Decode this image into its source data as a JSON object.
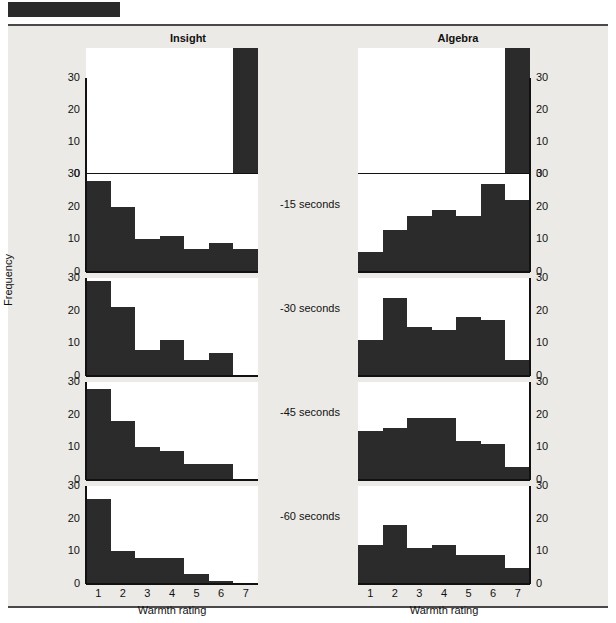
{
  "header": {
    "redacted_bar": true
  },
  "figure": {
    "column_titles": [
      "Insight",
      "Algebra"
    ],
    "ylabel": "Frequency",
    "xlabel": "Warmth rating",
    "row_labels": [
      "",
      "-15 seconds",
      "-30 seconds",
      "-45 seconds",
      "-60 seconds"
    ],
    "bar_color": "#2b2b2b",
    "plate_background": "#eceae6",
    "panel_background": "#ffffff"
  },
  "chart_data": {
    "type": "bar",
    "xlabel": "Warmth rating",
    "ylabel": "Frequency",
    "categories": [
      "1",
      "2",
      "3",
      "4",
      "5",
      "6",
      "7"
    ],
    "ylim": [
      0,
      30
    ],
    "yticks": [
      0,
      10,
      20,
      30
    ],
    "grid": false,
    "legend": "none",
    "layout": "5 rows x 2 columns of small-multiple histograms",
    "columns": [
      "Insight",
      "Algebra"
    ],
    "rows": [
      "solution",
      "-15 seconds",
      "-30 seconds",
      "-45 seconds",
      "-60 seconds"
    ],
    "axis_break_note": "Top row bars at rating 7 are truncated; zigzag break symbol indicates value exceeds the 30 axis maximum",
    "panels": [
      {
        "row": "solution",
        "row_label": "",
        "column": "Insight",
        "values": [
          0,
          0,
          0,
          0,
          0,
          0,
          38
        ],
        "truncated_bars": [
          7
        ],
        "axis_break": true
      },
      {
        "row": "solution",
        "row_label": "",
        "column": "Algebra",
        "values": [
          0,
          0,
          0,
          0,
          0,
          0,
          38
        ],
        "truncated_bars": [
          7
        ],
        "axis_break": true
      },
      {
        "row": "-15 seconds",
        "row_label": "-15 seconds",
        "column": "Insight",
        "values": [
          28,
          20,
          10,
          11,
          7,
          9,
          7
        ],
        "axis_break": false
      },
      {
        "row": "-15 seconds",
        "row_label": "-15 seconds",
        "column": "Algebra",
        "values": [
          6,
          13,
          17,
          19,
          17,
          27,
          22
        ],
        "axis_break": false
      },
      {
        "row": "-30 seconds",
        "row_label": "-30 seconds",
        "column": "Insight",
        "values": [
          29,
          21,
          8,
          11,
          5,
          7,
          0
        ],
        "axis_break": false
      },
      {
        "row": "-30 seconds",
        "row_label": "-30 seconds",
        "column": "Algebra",
        "values": [
          11,
          24,
          15,
          14,
          18,
          17,
          5
        ],
        "axis_break": false
      },
      {
        "row": "-45 seconds",
        "row_label": "-45 seconds",
        "column": "Insight",
        "values": [
          28,
          18,
          10,
          9,
          5,
          5,
          0
        ],
        "axis_break": false
      },
      {
        "row": "-45 seconds",
        "row_label": "-45 seconds",
        "column": "Algebra",
        "values": [
          15,
          16,
          19,
          19,
          12,
          11,
          4
        ],
        "axis_break": false
      },
      {
        "row": "-60 seconds",
        "row_label": "-60 seconds",
        "column": "Insight",
        "values": [
          26,
          10,
          8,
          8,
          3,
          1,
          0
        ],
        "axis_break": false
      },
      {
        "row": "-60 seconds",
        "row_label": "-60 seconds",
        "column": "Algebra",
        "values": [
          12,
          18,
          11,
          12,
          9,
          9,
          5
        ],
        "axis_break": false
      }
    ]
  }
}
